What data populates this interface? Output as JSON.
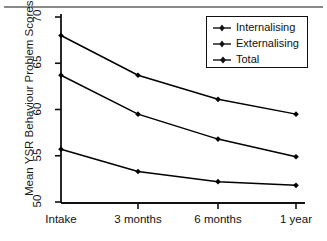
{
  "chart_data": {
    "type": "line",
    "title": "",
    "xlabel": "",
    "ylabel": "Mean YSR Behaviour Problem Scores",
    "categories": [
      "Intake",
      "3 months",
      "6 months",
      "1 year"
    ],
    "ylim": [
      50,
      70
    ],
    "yticks": [
      50,
      55,
      60,
      65,
      70
    ],
    "grid": false,
    "legend_position": "top-right",
    "series": [
      {
        "name": "Internalising",
        "values": [
          55.7,
          53.3,
          52.2,
          51.8
        ],
        "marker": "diamond",
        "color": "#000000"
      },
      {
        "name": "Externalising",
        "values": [
          63.7,
          59.5,
          56.8,
          54.9
        ],
        "marker": "diamond",
        "color": "#000000"
      },
      {
        "name": "Total",
        "values": [
          68.0,
          63.7,
          61.1,
          59.5
        ],
        "marker": "diamond",
        "color": "#000000"
      }
    ]
  },
  "axes": {
    "y_tick_labels": [
      "70",
      "65",
      "60",
      "55",
      "50"
    ],
    "x_tick_labels": [
      "Intake",
      "3 months",
      "6 months",
      "1 year"
    ],
    "y_axis_title": "Mean YSR Behaviour Problem Scores"
  },
  "legend": {
    "entries": [
      {
        "label": "Internalising"
      },
      {
        "label": "Externalising"
      },
      {
        "label": "Total"
      }
    ]
  },
  "colors": {
    "ink": "#111111",
    "rule": "#8a8a8a",
    "background": "#ffffff"
  }
}
